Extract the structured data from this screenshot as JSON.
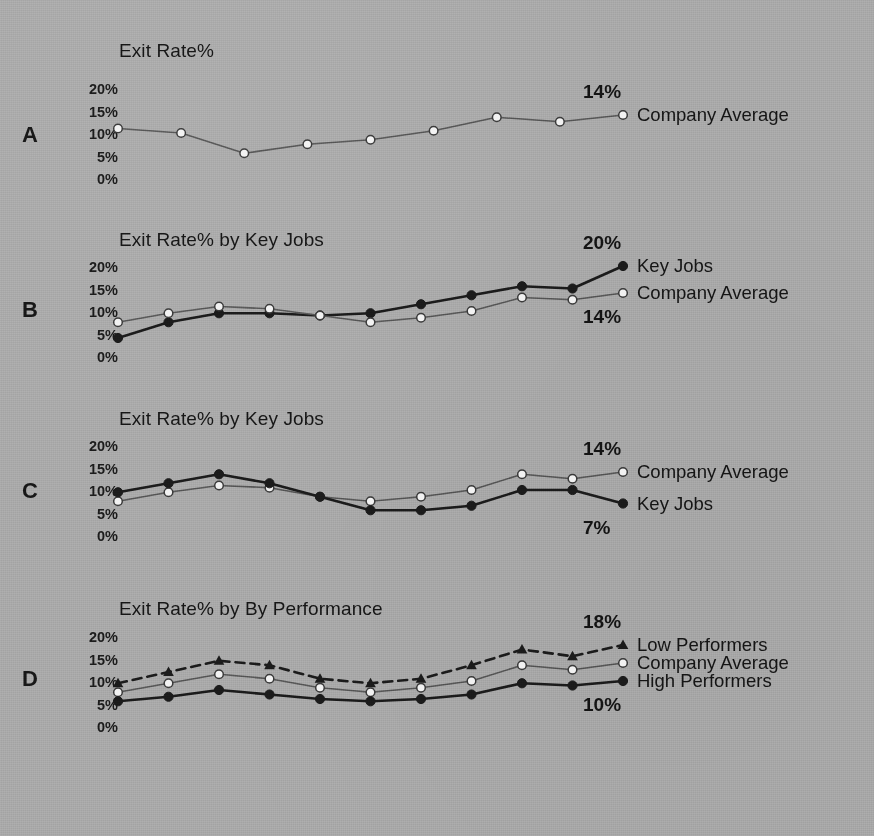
{
  "figure": {
    "background_color": "#a9a9a9",
    "ink_color": "#1b1b1b",
    "light_line_color": "#565656",
    "marker_open_fill": "#f2f2f2"
  },
  "y_ticks": [
    "20%",
    "15%",
    "10%",
    "5%",
    "0%"
  ],
  "panels": [
    {
      "letter": "A",
      "title": "Exit Rate%",
      "end_annotations": [
        {
          "text": "14%"
        }
      ],
      "series_labels": [
        "Company Average"
      ]
    },
    {
      "letter": "B",
      "title": "Exit Rate% by Key Jobs",
      "end_annotations": [
        {
          "text": "20%"
        },
        {
          "text": "14%"
        }
      ],
      "series_labels": [
        "Key Jobs",
        "Company Average"
      ]
    },
    {
      "letter": "C",
      "title": "Exit Rate% by Key Jobs",
      "end_annotations": [
        {
          "text": "14%"
        },
        {
          "text": "7%"
        }
      ],
      "series_labels": [
        "Company Average",
        "Key Jobs"
      ]
    },
    {
      "letter": "D",
      "title": "Exit Rate% by By Performance",
      "end_annotations": [
        {
          "text": "18%"
        },
        {
          "text": "10%"
        }
      ],
      "series_labels": [
        "Low Performers",
        "Company Average",
        "High Performers"
      ]
    }
  ],
  "chart_data": [
    {
      "type": "line",
      "panel": "A",
      "title": "Exit Rate%",
      "xlabel": "",
      "ylabel": "Exit Rate%",
      "ylim": [
        0,
        22
      ],
      "yticks": [
        0,
        5,
        10,
        15,
        20
      ],
      "ytick_labels": [
        "0%",
        "5%",
        "10%",
        "15%",
        "20%"
      ],
      "grid": false,
      "legend_position": "right-of-line-end",
      "x": [
        1,
        2,
        3,
        4,
        5,
        6,
        7,
        8,
        9
      ],
      "series": [
        {
          "name": "Company Average",
          "marker": "open-circle",
          "line": "solid",
          "values": [
            11.0,
            10.0,
            5.5,
            7.5,
            8.5,
            10.5,
            13.5,
            12.5,
            14.0
          ],
          "end_label": "14%"
        }
      ]
    },
    {
      "type": "line",
      "panel": "B",
      "title": "Exit Rate% by Key Jobs",
      "xlabel": "",
      "ylabel": "Exit Rate%",
      "ylim": [
        0,
        22
      ],
      "yticks": [
        0,
        5,
        10,
        15,
        20
      ],
      "ytick_labels": [
        "0%",
        "5%",
        "10%",
        "15%",
        "20%"
      ],
      "grid": false,
      "legend_position": "right-of-line-end",
      "x": [
        1,
        2,
        3,
        4,
        5,
        6,
        7,
        8,
        9,
        10,
        11
      ],
      "series": [
        {
          "name": "Key Jobs",
          "marker": "filled-circle",
          "line": "solid",
          "values": [
            4.0,
            7.5,
            9.5,
            9.5,
            9.0,
            9.5,
            11.5,
            13.5,
            15.5,
            15.0,
            20.0
          ],
          "end_label": "20%"
        },
        {
          "name": "Company Average",
          "marker": "open-circle",
          "line": "solid",
          "values": [
            7.5,
            9.5,
            11.0,
            10.5,
            9.0,
            7.5,
            8.5,
            10.0,
            13.0,
            12.5,
            14.0
          ],
          "end_label": "14%"
        }
      ]
    },
    {
      "type": "line",
      "panel": "C",
      "title": "Exit Rate% by Key Jobs",
      "xlabel": "",
      "ylabel": "Exit Rate%",
      "ylim": [
        0,
        22
      ],
      "yticks": [
        0,
        5,
        10,
        15,
        20
      ],
      "ytick_labels": [
        "0%",
        "5%",
        "10%",
        "15%",
        "20%"
      ],
      "grid": false,
      "legend_position": "right-of-line-end",
      "x": [
        1,
        2,
        3,
        4,
        5,
        6,
        7,
        8,
        9,
        10,
        11
      ],
      "series": [
        {
          "name": "Company Average",
          "marker": "open-circle",
          "line": "solid",
          "values": [
            7.5,
            9.5,
            11.0,
            10.5,
            8.5,
            7.5,
            8.5,
            10.0,
            13.5,
            12.5,
            14.0
          ],
          "end_label": "14%"
        },
        {
          "name": "Key Jobs",
          "marker": "filled-circle",
          "line": "solid",
          "values": [
            9.5,
            11.5,
            13.5,
            11.5,
            8.5,
            5.5,
            5.5,
            6.5,
            10.0,
            10.0,
            7.0
          ],
          "end_label": "7%"
        }
      ]
    },
    {
      "type": "line",
      "panel": "D",
      "title": "Exit Rate% by By Performance",
      "xlabel": "",
      "ylabel": "Exit Rate%",
      "ylim": [
        0,
        22
      ],
      "yticks": [
        0,
        5,
        10,
        15,
        20
      ],
      "ytick_labels": [
        "0%",
        "5%",
        "10%",
        "15%",
        "20%"
      ],
      "grid": false,
      "legend_position": "right-of-line-end",
      "x": [
        1,
        2,
        3,
        4,
        5,
        6,
        7,
        8,
        9,
        10,
        11
      ],
      "series": [
        {
          "name": "Low Performers",
          "marker": "filled-triangle",
          "line": "dashed",
          "values": [
            9.5,
            12.0,
            14.5,
            13.5,
            10.5,
            9.5,
            10.5,
            13.5,
            17.0,
            15.5,
            18.0
          ],
          "end_label": "18%"
        },
        {
          "name": "Company Average",
          "marker": "open-circle",
          "line": "solid",
          "values": [
            7.5,
            9.5,
            11.5,
            10.5,
            8.5,
            7.5,
            8.5,
            10.0,
            13.5,
            12.5,
            14.0
          ],
          "end_label": ""
        },
        {
          "name": "High Performers",
          "marker": "filled-circle",
          "line": "solid",
          "values": [
            5.5,
            6.5,
            8.0,
            7.0,
            6.0,
            5.5,
            6.0,
            7.0,
            9.5,
            9.0,
            10.0
          ],
          "end_label": "10%"
        }
      ]
    }
  ]
}
